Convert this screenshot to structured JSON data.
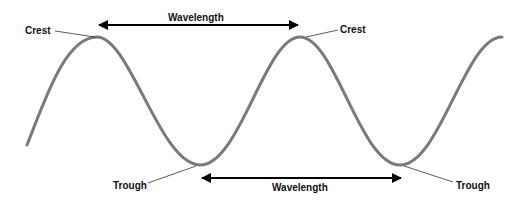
{
  "diagram": {
    "type": "transverse-wave",
    "colors": {
      "wave": "#7a7a7a",
      "arrow": "#000000",
      "leader": "#333333",
      "text": "#111111",
      "background": "#ffffff"
    },
    "labels": {
      "crest_left": "Crest",
      "crest_right": "Crest",
      "trough_left": "Trough",
      "trough_right": "Trough",
      "wavelength_top": "Wavelength",
      "wavelength_bottom": "Wavelength"
    },
    "points": {
      "crests": [
        [
          97,
          37
        ],
        [
          300,
          37
        ]
      ],
      "troughs": [
        [
          200,
          165
        ],
        [
          400,
          165
        ]
      ],
      "wave_start": [
        27,
        145
      ],
      "wave_end": [
        502,
        37
      ]
    },
    "arrows": {
      "top": {
        "x1": 97,
        "x2": 300,
        "y": 25,
        "double_headed": true
      },
      "bottom": {
        "x1": 200,
        "x2": 403,
        "y": 178,
        "double_headed": true
      }
    }
  }
}
